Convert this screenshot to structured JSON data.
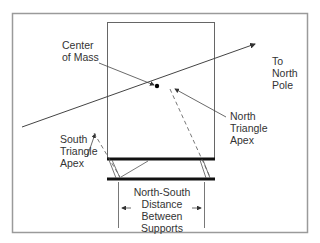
{
  "diagram": {
    "type": "physics-schematic",
    "labels": {
      "center_of_mass": [
        "Center",
        "of Mass"
      ],
      "to_north_pole": [
        "To",
        "North",
        "Pole"
      ],
      "north_triangle_apex": [
        "North",
        "Triangle",
        "Apex"
      ],
      "south_triangle_apex": [
        "South",
        "Triangle",
        "Apex"
      ],
      "distance": [
        "North-South",
        "Distance",
        "Between",
        "Supports"
      ]
    },
    "colors": {
      "frame": "#9a9a9a",
      "line": "#444444",
      "thick_bar": "#111111",
      "text": "#333333"
    }
  }
}
